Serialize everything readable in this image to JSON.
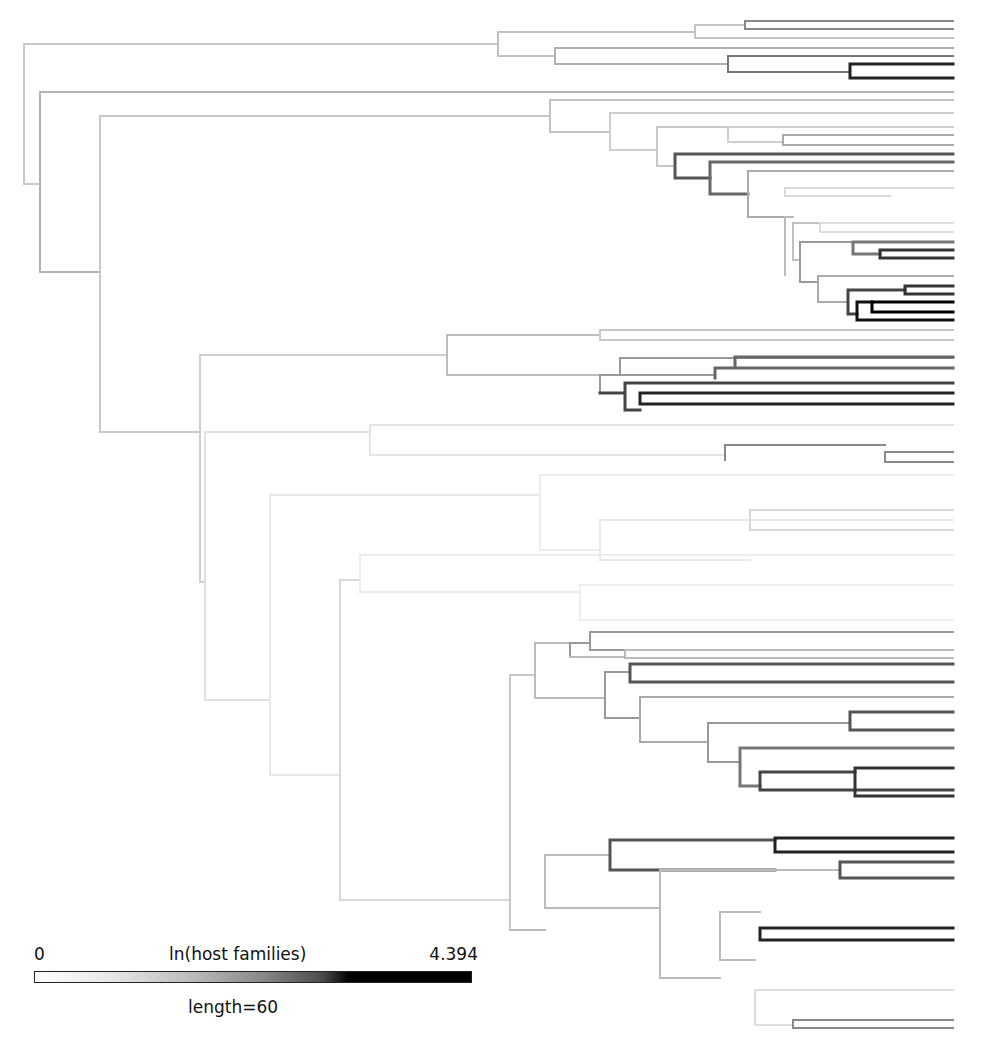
{
  "legend": {
    "min_label": "0",
    "title": "ln(host families)",
    "max_label": "4.394",
    "scale_label": "length=60",
    "gradient": [
      "#ffffff",
      "#bdbdbd",
      "#4a4a4a",
      "#000000"
    ]
  },
  "tree": {
    "tip_x": 953,
    "branches": [
      {
        "d": "M24 44 V184 M24 44 H498 M24 184 H40",
        "c": "#c8c8c8",
        "w": 2
      },
      {
        "d": "M40 92 V272 M40 92 H953 M40 272 H100",
        "c": "#b4b4b4",
        "w": 2
      },
      {
        "d": "M100 116 V432 M100 116 H550 M100 432 H200",
        "c": "#c8c8c8",
        "w": 2
      },
      {
        "d": "M498 32 V56 M498 32 H695 M498 56 H555",
        "c": "#c0c0c0",
        "w": 2
      },
      {
        "d": "M695 25 V38 M695 25 H745 M695 38 H953",
        "c": "#c4c4c4",
        "w": 2
      },
      {
        "d": "M745 21 V29 M745 21 H953 M745 29 H953",
        "c": "#888",
        "w": 2
      },
      {
        "d": "M555 48 V64 M555 48 H953 M555 64 H728",
        "c": "#b0b0b0",
        "w": 2
      },
      {
        "d": "M728 56 V72 M728 56 H953 M728 72 H850",
        "c": "#777",
        "w": 2
      },
      {
        "d": "M850 64 V78 M850 64 H953 M850 78 H953",
        "c": "#222",
        "w": 3
      },
      {
        "d": "M550 100 V132 M550 100 H953 M550 132 H610",
        "c": "#c4c4c4",
        "w": 2
      },
      {
        "d": "M610 113 V150 M610 113 H953 M610 150 H657",
        "c": "#cfcfcf",
        "w": 2
      },
      {
        "d": "M657 127 V166 M657 127 H728 M657 166 H675",
        "c": "#c8c8c8",
        "w": 2
      },
      {
        "d": "M728 127 V142 M728 127 H953 M728 142 H783",
        "c": "#d0d0d0",
        "w": 2
      },
      {
        "d": "M783 135 V145 M783 135 H953 M783 145 H953",
        "c": "#aaa",
        "w": 2
      },
      {
        "d": "M675 154 V178 M675 154 H953 M675 178 H710",
        "c": "#555",
        "w": 3
      },
      {
        "d": "M710 162 V194 M710 162 H953 M710 194 H748",
        "c": "#666",
        "w": 3
      },
      {
        "d": "M748 171 V217 M748 171 H953 M748 217 H785",
        "c": "#aaa",
        "w": 2
      },
      {
        "d": "M785 188 V196 M785 188 H953 M785 196 H890",
        "c": "#d8d8d8",
        "w": 2
      },
      {
        "d": "M785 217 V275 M785 217 H793",
        "c": "#bbb",
        "w": 2
      },
      {
        "d": "M793 223 V260 M793 223 H820 M793 260 H800",
        "c": "#c0c0c0",
        "w": 2
      },
      {
        "d": "M820 223 V232 M820 223 H953 M820 232 H953",
        "c": "#ddd",
        "w": 2
      },
      {
        "d": "M800 242 V282 M800 242 H853 M800 282 H818",
        "c": "#999",
        "w": 2
      },
      {
        "d": "M853 242 V254 M853 242 H953 M853 254 H880",
        "c": "#777",
        "w": 3
      },
      {
        "d": "M880 250 V258 M880 250 H953 M880 258 H953",
        "c": "#333",
        "w": 3
      },
      {
        "d": "M818 276 V302 M818 276 H953 M818 302 H848",
        "c": "#aaa",
        "w": 2
      },
      {
        "d": "M848 290 V314 M848 290 H905 M848 314 H857",
        "c": "#444",
        "w": 3
      },
      {
        "d": "M905 286 V294 M905 286 H953 M905 294 H953",
        "c": "#333",
        "w": 3
      },
      {
        "d": "M857 302 V320 M857 302 H872 M857 320 H953",
        "c": "#111",
        "w": 3
      },
      {
        "d": "M872 302 V312 M872 302 H953 M872 312 H953",
        "c": "#000",
        "w": 3
      },
      {
        "d": "M200 355 V582 M200 355 H447 M200 582 H205",
        "c": "#cfcfcf",
        "w": 2
      },
      {
        "d": "M447 335 V375 M447 335 H600 M447 375 H600",
        "c": "#bdbdbd",
        "w": 2
      },
      {
        "d": "M600 330 V340 M600 330 H953 M600 340 H953",
        "c": "#c8c8c8",
        "w": 2
      },
      {
        "d": "M600 375 V393 M600 375 H620 M620 358 V375 M620 358 H953 M620 375 H715",
        "c": "#999",
        "w": 2
      },
      {
        "d": "M715 368 V378 M715 368 H735 M735 357 V368 M735 357 H953 M735 368 H953",
        "c": "#666",
        "w": 3
      },
      {
        "d": "M600 393 H625 M625 383 V410 M625 383 H953 M625 410 H640",
        "c": "#444",
        "w": 3
      },
      {
        "d": "M640 393 V404 M640 393 H953 M640 404 H953",
        "c": "#222",
        "w": 3
      },
      {
        "d": "M205 432 V700 M205 432 H370 M205 700 H270",
        "c": "#e0e0e0",
        "w": 2
      },
      {
        "d": "M370 425 V455 M370 425 H953 M370 455 H725",
        "c": "#e4e4e4",
        "w": 2
      },
      {
        "d": "M725 445 V460 M725 445 H885 M885 452 V462 M885 452 H953 M885 462 H953",
        "c": "#888",
        "w": 2
      },
      {
        "d": "M270 495 V775 M270 495 H540 M270 775 H340",
        "c": "#e8e8e8",
        "w": 2
      },
      {
        "d": "M540 475 V550 M540 475 H953 M540 550 H600",
        "c": "#ececec",
        "w": 2
      },
      {
        "d": "M600 520 V560 M600 520 H953 M600 560 H750",
        "c": "#eaeaea",
        "w": 2
      },
      {
        "d": "M750 510 V530 M750 510 H953 M750 530 H953",
        "c": "#d8d8d8",
        "w": 2
      },
      {
        "d": "M340 580 V900 M340 580 H360 M340 900 H510",
        "c": "#d8d8d8",
        "w": 2
      },
      {
        "d": "M360 555 V592 M360 555 H953 M360 592 H580",
        "c": "#ececec",
        "w": 2
      },
      {
        "d": "M580 585 V620 M580 585 H953 M580 620 H953",
        "c": "#eeeeee",
        "w": 2
      },
      {
        "d": "M510 675 V930 M510 675 H535",
        "c": "#c8c8c8",
        "w": 2
      },
      {
        "d": "M535 643 V698 M535 643 H570 M535 698 H605",
        "c": "#bbb",
        "w": 2
      },
      {
        "d": "M570 643 V657 M570 643 H590 M590 632 V650 M590 632 H953 M590 650 H953",
        "c": "#999",
        "w": 2
      },
      {
        "d": "M570 657 H625 M625 650 V658 M625 650 H953 M625 658 H953",
        "c": "#bbb",
        "w": 2
      },
      {
        "d": "M605 672 V718 M605 672 H630 M605 718 H640",
        "c": "#999",
        "w": 2
      },
      {
        "d": "M630 664 V682 M630 664 H953 M630 682 H953",
        "c": "#555",
        "w": 3
      },
      {
        "d": "M640 697 V742 M640 697 H953 M640 742 H708",
        "c": "#aaa",
        "w": 2
      },
      {
        "d": "M708 723 V762 M708 723 H850 M708 762 H740",
        "c": "#999",
        "w": 2
      },
      {
        "d": "M850 712 V730 M850 712 H953 M850 730 H953",
        "c": "#555",
        "w": 3
      },
      {
        "d": "M740 748 V786 M740 748 H953 M740 786 H760",
        "c": "#777",
        "w": 3
      },
      {
        "d": "M760 772 V790 M760 772 H855 M760 790 H953",
        "c": "#444",
        "w": 3
      },
      {
        "d": "M855 768 V796 M855 768 H953 M855 796 H953",
        "c": "#333",
        "w": 3
      },
      {
        "d": "M510 930 H545 M545 855 V908 M545 855 H610 M545 908 H660",
        "c": "#bbb",
        "w": 2
      },
      {
        "d": "M610 840 V870 M610 840 H775 M610 870 H775",
        "c": "#555",
        "w": 3
      },
      {
        "d": "M775 838 V852 M775 838 H953 M775 852 H953",
        "c": "#222",
        "w": 3
      },
      {
        "d": "M660 870 V978 M660 870 H840 M660 978 H720",
        "c": "#bbb",
        "w": 2
      },
      {
        "d": "M840 862 V878 M840 862 H953 M840 878 H953",
        "c": "#555",
        "w": 3
      },
      {
        "d": "M720 912 V960 M720 912 H760 M720 960 H755",
        "c": "#bbb",
        "w": 2
      },
      {
        "d": "M760 928 V940 M760 928 H953 M760 940 H953",
        "c": "#222",
        "w": 3
      },
      {
        "d": "M755 990 V1025 M755 990 H953 M755 1025 H793",
        "c": "#ddd",
        "w": 2
      },
      {
        "d": "M793 1020 V1028 M793 1020 H953 M793 1028 H953",
        "c": "#888",
        "w": 2
      }
    ]
  }
}
